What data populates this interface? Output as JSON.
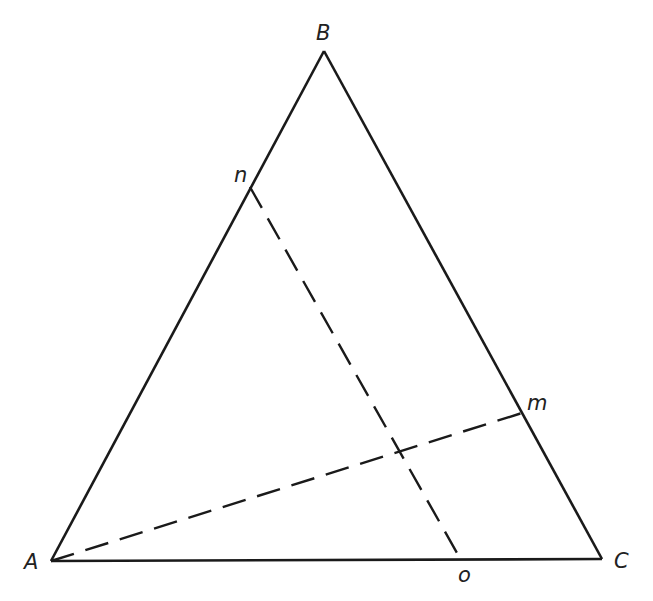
{
  "diagram": {
    "type": "triangle-with-cevians",
    "colors": {
      "stroke": "#1a1a1a",
      "label": "#222222",
      "background": "#ffffff"
    },
    "vertices": {
      "A": {
        "label": "A",
        "x": 51,
        "y": 561
      },
      "B": {
        "label": "B",
        "x": 324,
        "y": 51
      },
      "C": {
        "label": "C",
        "x": 602,
        "y": 559
      }
    },
    "points": {
      "n": {
        "label": "n",
        "x": 250,
        "y": 187,
        "on": "AB"
      },
      "m": {
        "label": "m",
        "x": 522,
        "y": 413,
        "on": "BC"
      },
      "o": {
        "label": "o",
        "x": 461,
        "y": 560,
        "on": "AC"
      }
    },
    "lines": [
      {
        "from": "A",
        "to": "m",
        "style": "dashed"
      },
      {
        "from": "n",
        "to": "o",
        "style": "dashed"
      }
    ],
    "labels": {
      "A": "A",
      "B": "B",
      "C": "C",
      "n": "n",
      "m": "m",
      "o": "o"
    }
  }
}
